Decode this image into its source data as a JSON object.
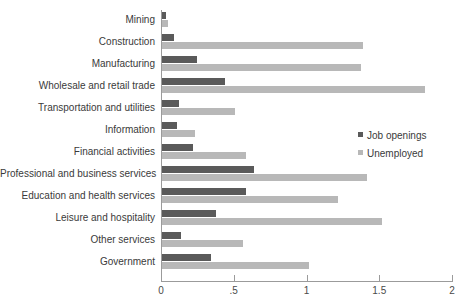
{
  "chart_data": {
    "type": "bar",
    "orientation": "horizontal",
    "title": "",
    "xlabel": "",
    "ylabel": "",
    "xlim": [
      0,
      2
    ],
    "grid": false,
    "legend_position": "middle-right",
    "xticks": [
      {
        "value": 0,
        "label": "0"
      },
      {
        "value": 0.5,
        "label": ".5"
      },
      {
        "value": 1,
        "label": "1"
      },
      {
        "value": 1.5,
        "label": "1.5"
      },
      {
        "value": 2,
        "label": "2"
      }
    ],
    "categories": [
      "Mining",
      "Construction",
      "Manufacturing",
      "Wholesale and retail trade",
      "Transportation and utilities",
      "Information",
      "Financial activities",
      "Professional and business services",
      "Education and health services",
      "Leisure and hospitality",
      "Other services",
      "Government"
    ],
    "series": [
      {
        "name": "Job openings",
        "color": "#5a5a5a",
        "values": [
          0.03,
          0.08,
          0.24,
          0.43,
          0.12,
          0.1,
          0.21,
          0.63,
          0.58,
          0.37,
          0.13,
          0.34
        ]
      },
      {
        "name": "Unemployed",
        "color": "#b8b8b8",
        "values": [
          0.04,
          1.38,
          1.37,
          1.81,
          0.5,
          0.23,
          0.58,
          1.41,
          1.21,
          1.51,
          0.56,
          1.01
        ]
      }
    ]
  },
  "legend": {
    "items": [
      {
        "label": "Job openings"
      },
      {
        "label": "Unemployed"
      }
    ]
  }
}
